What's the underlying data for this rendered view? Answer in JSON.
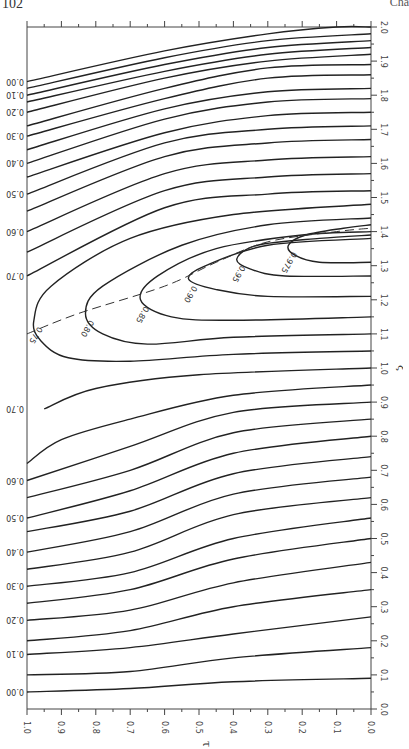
{
  "page": {
    "page_number": "102",
    "running_head": "Cha"
  },
  "chart_data": {
    "type": "contour",
    "orientation": "rotated 90° (printed sideways)",
    "title": "",
    "xlabel": "τ",
    "ylabel": "ξ",
    "xlim": [
      1.0,
      0.0
    ],
    "ylim": [
      0.0,
      2.0
    ],
    "x_ticks": [
      "1.0",
      "0.9",
      "0.8",
      "0.7",
      "0.6",
      "0.5",
      "0.4",
      "0.3",
      "0.2",
      "0.1",
      "0.0"
    ],
    "x_tick_values": [
      1.0,
      0.9,
      0.8,
      0.7,
      0.6,
      0.5,
      0.4,
      0.3,
      0.2,
      0.1,
      0.0
    ],
    "y_ticks": [
      "0.0",
      "0.1",
      "0.2",
      "0.3",
      "0.4",
      "0.5",
      "0.6",
      "0.7",
      "0.8",
      "0.9",
      "1.0",
      "1.1",
      "1.2",
      "1.3",
      "1.4",
      "1.5",
      "1.6",
      "1.7",
      "1.8",
      "1.9",
      "2.0"
    ],
    "y_tick_values": [
      0.0,
      0.1,
      0.2,
      0.3,
      0.4,
      0.5,
      0.6,
      0.7,
      0.8,
      0.9,
      1.0,
      1.1,
      1.2,
      1.3,
      1.4,
      1.5,
      1.6,
      1.7,
      1.8,
      1.9,
      2.0
    ],
    "grid": false,
    "left_edge_labels_lower": [
      "0.00",
      "0.10",
      "0.20",
      "0.30",
      "0.40",
      "0.50",
      "0.60",
      "0.70"
    ],
    "left_edge_labels_upper": [
      "0.00",
      "0.10",
      "0.20",
      "0.30",
      "0.40",
      "0.50",
      "0.60",
      "0.70"
    ],
    "inner_labels": [
      "0.75",
      "0.80",
      "0.85",
      "0.90",
      "0.95",
      "0.975"
    ],
    "ridge_line": {
      "style": "dashed",
      "points": [
        [
          1.0,
          1.1
        ],
        [
          0.85,
          1.16
        ],
        [
          0.6,
          1.24
        ],
        [
          0.45,
          1.31
        ],
        [
          0.3,
          1.37
        ],
        [
          0.1,
          1.4
        ],
        [
          0.0,
          1.41
        ]
      ]
    },
    "contours_lower": [
      {
        "level": "0.05",
        "points": [
          [
            1.0,
            0.05
          ],
          [
            0.7,
            0.06
          ],
          [
            0.4,
            0.08
          ],
          [
            0.0,
            0.09
          ]
        ]
      },
      {
        "level": "0.10",
        "points": [
          [
            1.0,
            0.1
          ],
          [
            0.7,
            0.11
          ],
          [
            0.4,
            0.15
          ],
          [
            0.0,
            0.18
          ]
        ]
      },
      {
        "level": "0.15",
        "points": [
          [
            1.0,
            0.16
          ],
          [
            0.7,
            0.18
          ],
          [
            0.4,
            0.22
          ],
          [
            0.0,
            0.27
          ]
        ]
      },
      {
        "level": "0.20",
        "points": [
          [
            1.0,
            0.2
          ],
          [
            0.7,
            0.23
          ],
          [
            0.4,
            0.3
          ],
          [
            0.0,
            0.35
          ]
        ]
      },
      {
        "level": "0.25",
        "points": [
          [
            1.0,
            0.26
          ],
          [
            0.7,
            0.29
          ],
          [
            0.4,
            0.37
          ],
          [
            0.0,
            0.43
          ]
        ]
      },
      {
        "level": "0.30",
        "points": [
          [
            1.0,
            0.31
          ],
          [
            0.7,
            0.35
          ],
          [
            0.4,
            0.44
          ],
          [
            0.0,
            0.5
          ]
        ]
      },
      {
        "level": "0.35",
        "points": [
          [
            1.0,
            0.36
          ],
          [
            0.7,
            0.4
          ],
          [
            0.4,
            0.5
          ],
          [
            0.0,
            0.56
          ]
        ]
      },
      {
        "level": "0.40",
        "points": [
          [
            1.0,
            0.41
          ],
          [
            0.7,
            0.46
          ],
          [
            0.4,
            0.57
          ],
          [
            0.0,
            0.62
          ]
        ]
      },
      {
        "level": "0.45",
        "points": [
          [
            1.0,
            0.46
          ],
          [
            0.7,
            0.52
          ],
          [
            0.4,
            0.63
          ],
          [
            0.0,
            0.68
          ]
        ]
      },
      {
        "level": "0.50",
        "points": [
          [
            1.0,
            0.52
          ],
          [
            0.7,
            0.58
          ],
          [
            0.4,
            0.69
          ],
          [
            0.0,
            0.74
          ]
        ]
      },
      {
        "level": "0.55",
        "points": [
          [
            1.0,
            0.56
          ],
          [
            0.7,
            0.64
          ],
          [
            0.4,
            0.75
          ],
          [
            0.0,
            0.8
          ]
        ]
      },
      {
        "level": "0.60",
        "points": [
          [
            1.0,
            0.62
          ],
          [
            0.7,
            0.7
          ],
          [
            0.4,
            0.81
          ],
          [
            0.0,
            0.85
          ]
        ]
      },
      {
        "level": "0.65",
        "points": [
          [
            1.0,
            0.67
          ],
          [
            0.7,
            0.77
          ],
          [
            0.4,
            0.87
          ],
          [
            0.0,
            0.9
          ]
        ]
      },
      {
        "level": "0.70",
        "points": [
          [
            1.0,
            0.72
          ],
          [
            0.9,
            0.79
          ],
          [
            0.7,
            0.85
          ],
          [
            0.4,
            0.92
          ],
          [
            0.0,
            0.95
          ]
        ]
      },
      {
        "level": "0.72",
        "points": [
          [
            0.95,
            0.88
          ],
          [
            0.8,
            0.94
          ],
          [
            0.5,
            0.98
          ],
          [
            0.0,
            1.0
          ]
        ]
      }
    ],
    "contours_upper": [
      {
        "level": "0.00",
        "points": [
          [
            1.0,
            1.84
          ],
          [
            0.6,
            1.93
          ],
          [
            0.3,
            1.98
          ],
          [
            0.1,
            2.0
          ],
          [
            0.0,
            2.0
          ]
        ]
      },
      {
        "level": "0.05",
        "points": [
          [
            1.0,
            1.82
          ],
          [
            0.6,
            1.91
          ],
          [
            0.3,
            1.96
          ],
          [
            0.0,
            1.98
          ]
        ]
      },
      {
        "level": "0.10",
        "points": [
          [
            1.0,
            1.8
          ],
          [
            0.6,
            1.89
          ],
          [
            0.3,
            1.94
          ],
          [
            0.0,
            1.96
          ]
        ]
      },
      {
        "level": "0.15",
        "points": [
          [
            1.0,
            1.78
          ],
          [
            0.6,
            1.87
          ],
          [
            0.3,
            1.92
          ],
          [
            0.0,
            1.94
          ]
        ]
      },
      {
        "level": "0.20",
        "points": [
          [
            1.0,
            1.75
          ],
          [
            0.6,
            1.85
          ],
          [
            0.3,
            1.9
          ],
          [
            0.0,
            1.92
          ]
        ]
      },
      {
        "level": "0.25",
        "points": [
          [
            1.0,
            1.71
          ],
          [
            0.6,
            1.82
          ],
          [
            0.3,
            1.88
          ],
          [
            0.0,
            1.89
          ]
        ]
      },
      {
        "level": "0.30",
        "points": [
          [
            1.0,
            1.68
          ],
          [
            0.6,
            1.79
          ],
          [
            0.3,
            1.85
          ],
          [
            0.0,
            1.86
          ]
        ]
      },
      {
        "level": "0.35",
        "points": [
          [
            1.0,
            1.64
          ],
          [
            0.6,
            1.76
          ],
          [
            0.3,
            1.81
          ],
          [
            0.0,
            1.82
          ]
        ]
      },
      {
        "level": "0.40",
        "points": [
          [
            1.0,
            1.6
          ],
          [
            0.6,
            1.73
          ],
          [
            0.3,
            1.78
          ],
          [
            0.0,
            1.79
          ]
        ]
      },
      {
        "level": "0.45",
        "points": [
          [
            1.0,
            1.56
          ],
          [
            0.6,
            1.69
          ],
          [
            0.3,
            1.74
          ],
          [
            0.0,
            1.75
          ]
        ]
      },
      {
        "level": "0.50",
        "points": [
          [
            1.0,
            1.51
          ],
          [
            0.6,
            1.66
          ],
          [
            0.3,
            1.7
          ],
          [
            0.0,
            1.71
          ]
        ]
      },
      {
        "level": "0.55",
        "points": [
          [
            1.0,
            1.46
          ],
          [
            0.6,
            1.62
          ],
          [
            0.3,
            1.66
          ],
          [
            0.0,
            1.67
          ]
        ]
      },
      {
        "level": "0.60",
        "points": [
          [
            1.0,
            1.4
          ],
          [
            0.6,
            1.57
          ],
          [
            0.3,
            1.61
          ],
          [
            0.0,
            1.62
          ]
        ]
      },
      {
        "level": "0.65",
        "points": [
          [
            1.0,
            1.34
          ],
          [
            0.6,
            1.52
          ],
          [
            0.3,
            1.56
          ],
          [
            0.0,
            1.57
          ]
        ]
      },
      {
        "level": "0.70",
        "points": [
          [
            1.0,
            1.27
          ],
          [
            0.6,
            1.47
          ],
          [
            0.3,
            1.51
          ],
          [
            0.0,
            1.52
          ]
        ]
      }
    ],
    "contours_closed": [
      {
        "level": "0.75",
        "label": "0.75",
        "points": [
          [
            0.0,
            1.05
          ],
          [
            0.4,
            1.04
          ],
          [
            0.7,
            1.02
          ],
          [
            0.88,
            1.03
          ],
          [
            0.96,
            1.08
          ],
          [
            0.98,
            1.14
          ],
          [
            0.93,
            1.24
          ],
          [
            0.7,
            1.38
          ],
          [
            0.4,
            1.45
          ],
          [
            0.0,
            1.48
          ]
        ]
      },
      {
        "level": "0.80",
        "label": "0.80",
        "points": [
          [
            0.0,
            1.1
          ],
          [
            0.4,
            1.09
          ],
          [
            0.65,
            1.07
          ],
          [
            0.78,
            1.1
          ],
          [
            0.83,
            1.16
          ],
          [
            0.78,
            1.24
          ],
          [
            0.55,
            1.36
          ],
          [
            0.3,
            1.42
          ],
          [
            0.0,
            1.44
          ]
        ]
      },
      {
        "level": "0.85",
        "label": "0.85",
        "points": [
          [
            0.0,
            1.15
          ],
          [
            0.4,
            1.14
          ],
          [
            0.58,
            1.15
          ],
          [
            0.67,
            1.2
          ],
          [
            0.62,
            1.27
          ],
          [
            0.45,
            1.35
          ],
          [
            0.2,
            1.39
          ],
          [
            0.0,
            1.4
          ]
        ]
      },
      {
        "level": "0.90",
        "label": "0.90",
        "points": [
          [
            0.0,
            1.21
          ],
          [
            0.3,
            1.21
          ],
          [
            0.45,
            1.23
          ],
          [
            0.53,
            1.26
          ],
          [
            0.48,
            1.3
          ],
          [
            0.3,
            1.36
          ],
          [
            0.0,
            1.38
          ]
        ]
      },
      {
        "level": "0.95",
        "label": "0.95",
        "points": [
          [
            0.0,
            1.27
          ],
          [
            0.25,
            1.27
          ],
          [
            0.35,
            1.29
          ],
          [
            0.39,
            1.32
          ],
          [
            0.33,
            1.36
          ],
          [
            0.15,
            1.38
          ],
          [
            0.0,
            1.39
          ]
        ]
      },
      {
        "level": "0.975",
        "label": "0.975",
        "points": [
          [
            0.0,
            1.31
          ],
          [
            0.15,
            1.31
          ],
          [
            0.22,
            1.33
          ],
          [
            0.24,
            1.36
          ],
          [
            0.19,
            1.39
          ],
          [
            0.08,
            1.41
          ],
          [
            0.0,
            1.42
          ]
        ]
      }
    ]
  }
}
